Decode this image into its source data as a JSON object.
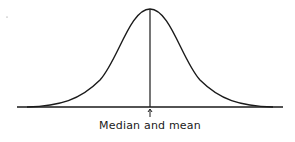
{
  "diagram": {
    "curve": "bell (symmetric normal distribution)",
    "annotation": {
      "label": "Median and mean",
      "marker": "up-arrow at center of distribution"
    },
    "colors": {
      "line": "#1a1a1a",
      "background": "#ffffff"
    }
  }
}
